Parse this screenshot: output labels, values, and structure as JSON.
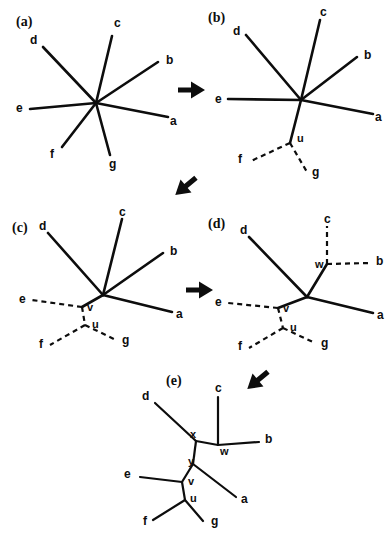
{
  "figure": {
    "background_color": "#ffffff",
    "ink_color": "#0d0d0d",
    "panels": [
      {
        "id": "a",
        "label": "(a)",
        "label_pos": [
          16,
          26
        ],
        "center": [
          96,
          103
        ],
        "solid_edges": [
          {
            "from": "center",
            "to": [
              43,
              47
            ],
            "taxon": "d"
          },
          {
            "from": "center",
            "to": [
              112,
              36
            ],
            "taxon": "c"
          },
          {
            "from": "center",
            "to": [
              158,
              62
            ],
            "taxon": "b"
          },
          {
            "from": "center",
            "to": [
              168,
              117
            ],
            "taxon": "a"
          },
          {
            "from": "center",
            "to": [
              30,
              109
            ],
            "taxon": "e"
          },
          {
            "from": "center",
            "to": [
              62,
              147
            ],
            "taxon": "f"
          },
          {
            "from": "center",
            "to": [
              110,
              155
            ],
            "taxon": "g"
          }
        ],
        "dashed_edges": [],
        "taxon_labels": [
          {
            "text": "d",
            "x": 30,
            "y": 44
          },
          {
            "text": "c",
            "x": 114,
            "y": 27
          },
          {
            "text": "b",
            "x": 166,
            "y": 64
          },
          {
            "text": "a",
            "x": 170,
            "y": 125
          },
          {
            "text": "e",
            "x": 16,
            "y": 112
          },
          {
            "text": "f",
            "x": 50,
            "y": 158
          },
          {
            "text": "g",
            "x": 109,
            "y": 168
          }
        ],
        "node_labels": []
      },
      {
        "id": "b",
        "label": "(b)",
        "label_pos": [
          208,
          22
        ],
        "center": [
          301,
          100
        ],
        "solid_edges": [
          {
            "from": "center",
            "to": [
              246,
              35
            ],
            "taxon": "d"
          },
          {
            "from": "center",
            "to": [
              320,
              20
            ],
            "taxon": "c"
          },
          {
            "from": "center",
            "to": [
              357,
              57
            ],
            "taxon": "b"
          },
          {
            "from": "center",
            "to": [
              373,
              114
            ],
            "taxon": "a"
          },
          {
            "from": "center",
            "to": [
              228,
              99
            ],
            "taxon": "e"
          },
          {
            "from": "center",
            "to": [
              290,
              143
            ],
            "taxon": "u"
          }
        ],
        "dashed_edges": [
          {
            "from": [
              290,
              143
            ],
            "to": [
              251,
              161
            ],
            "taxon": "f"
          },
          {
            "from": [
              290,
              143
            ],
            "to": [
              307,
              172
            ],
            "taxon": "g"
          }
        ],
        "taxon_labels": [
          {
            "text": "d",
            "x": 233,
            "y": 35
          },
          {
            "text": "c",
            "x": 320,
            "y": 16
          },
          {
            "text": "b",
            "x": 364,
            "y": 59
          },
          {
            "text": "a",
            "x": 375,
            "y": 121
          },
          {
            "text": "e",
            "x": 215,
            "y": 103
          },
          {
            "text": "f",
            "x": 238,
            "y": 163
          },
          {
            "text": "g",
            "x": 312,
            "y": 176
          }
        ],
        "node_labels": [
          {
            "text": "u",
            "x": 297,
            "y": 142
          }
        ]
      },
      {
        "id": "c",
        "label": "(c)",
        "label_pos": [
          12,
          232
        ],
        "center": [
          103,
          295
        ],
        "solid_edges": [
          {
            "from": "center",
            "to": [
              48,
              233
            ],
            "taxon": "d"
          },
          {
            "from": "center",
            "to": [
              122,
              219
            ],
            "taxon": "c"
          },
          {
            "from": "center",
            "to": [
              163,
              253
            ],
            "taxon": "b"
          },
          {
            "from": "center",
            "to": [
              172,
              312
            ],
            "taxon": "a"
          },
          {
            "from": "center",
            "to": [
              82,
              307
            ],
            "taxon": "v"
          }
        ],
        "dashed_edges": [
          {
            "from": [
              82,
              307
            ],
            "to": [
              32,
              300
            ],
            "taxon": "e"
          },
          {
            "from": [
              82,
              307
            ],
            "to": [
              85,
              325
            ],
            "taxon": "u"
          },
          {
            "from": [
              85,
              325
            ],
            "to": [
              50,
              345
            ],
            "taxon": "f"
          },
          {
            "from": [
              85,
              325
            ],
            "to": [
              116,
              340
            ],
            "taxon": "g"
          }
        ],
        "taxon_labels": [
          {
            "text": "d",
            "x": 39,
            "y": 230
          },
          {
            "text": "c",
            "x": 119,
            "y": 216
          },
          {
            "text": "b",
            "x": 170,
            "y": 255
          },
          {
            "text": "a",
            "x": 176,
            "y": 318
          },
          {
            "text": "e",
            "x": 19,
            "y": 303
          },
          {
            "text": "f",
            "x": 39,
            "y": 348
          },
          {
            "text": "g",
            "x": 122,
            "y": 344
          }
        ],
        "node_labels": [
          {
            "text": "v",
            "x": 87,
            "y": 311
          },
          {
            "text": "u",
            "x": 92,
            "y": 328
          }
        ]
      },
      {
        "id": "d",
        "label": "(d)",
        "label_pos": [
          208,
          228
        ],
        "center": [
          307,
          297
        ],
        "solid_edges": [
          {
            "from": "center",
            "to": [
              249,
              237
            ],
            "taxon": "d"
          },
          {
            "from": "center",
            "to": [
              327,
              264
            ],
            "taxon": "w"
          },
          {
            "from": "center",
            "to": [
              373,
              313
            ],
            "taxon": "a"
          },
          {
            "from": "center",
            "to": [
              278,
              308
            ],
            "taxon": "v"
          }
        ],
        "dashed_edges": [
          {
            "from": [
              327,
              264
            ],
            "to": [
              327,
              226
            ],
            "taxon": "c"
          },
          {
            "from": [
              327,
              264
            ],
            "to": [
              370,
              263
            ],
            "taxon": "b"
          },
          {
            "from": [
              278,
              308
            ],
            "to": [
              228,
              303
            ],
            "taxon": "e"
          },
          {
            "from": [
              278,
              308
            ],
            "to": [
              283,
              328
            ],
            "taxon": "u"
          },
          {
            "from": [
              283,
              328
            ],
            "to": [
              249,
              348
            ],
            "taxon": "f"
          },
          {
            "from": [
              283,
              328
            ],
            "to": [
              315,
              343
            ],
            "taxon": "g"
          }
        ],
        "taxon_labels": [
          {
            "text": "d",
            "x": 240,
            "y": 234
          },
          {
            "text": "c",
            "x": 324,
            "y": 223
          },
          {
            "text": "b",
            "x": 376,
            "y": 265
          },
          {
            "text": "a",
            "x": 377,
            "y": 319
          },
          {
            "text": "e",
            "x": 215,
            "y": 306
          },
          {
            "text": "f",
            "x": 238,
            "y": 350
          },
          {
            "text": "g",
            "x": 321,
            "y": 347
          }
        ],
        "node_labels": [
          {
            "text": "w",
            "x": 315,
            "y": 268
          },
          {
            "text": "v",
            "x": 283,
            "y": 312
          },
          {
            "text": "u",
            "x": 290,
            "y": 331
          }
        ]
      },
      {
        "id": "e",
        "label": "(e)",
        "label_pos": [
          166,
          385
        ],
        "center": null,
        "solid_edges": [
          {
            "from": [
              196,
              441
            ],
            "to": [
              155,
              403
            ],
            "taxon": "d"
          },
          {
            "from": [
              196,
              441
            ],
            "to": [
              218,
              445
            ],
            "taxon": "w"
          },
          {
            "from": [
              218,
              445
            ],
            "to": [
              218,
              397
            ],
            "taxon": "c"
          },
          {
            "from": [
              218,
              445
            ],
            "to": [
              259,
              442
            ],
            "taxon": "b"
          },
          {
            "from": [
              196,
              441
            ],
            "to": [
              193,
              464
            ],
            "taxon": "y"
          },
          {
            "from": [
              193,
              464
            ],
            "to": [
              182,
              482
            ],
            "taxon": "v"
          },
          {
            "from": [
              193,
              464
            ],
            "to": [
              236,
              497
            ],
            "taxon": "a"
          },
          {
            "from": [
              182,
              482
            ],
            "to": [
              140,
              477
            ],
            "taxon": "e"
          },
          {
            "from": [
              182,
              482
            ],
            "to": [
              185,
              500
            ],
            "taxon": "u"
          },
          {
            "from": [
              185,
              500
            ],
            "to": [
              153,
              520
            ],
            "taxon": "f"
          },
          {
            "from": [
              185,
              500
            ],
            "to": [
              203,
              521
            ],
            "taxon": "g"
          }
        ],
        "dashed_edges": [],
        "taxon_labels": [
          {
            "text": "d",
            "x": 142,
            "y": 400
          },
          {
            "text": "c",
            "x": 215,
            "y": 392
          },
          {
            "text": "b",
            "x": 265,
            "y": 443
          },
          {
            "text": "a",
            "x": 241,
            "y": 503
          },
          {
            "text": "e",
            "x": 124,
            "y": 478
          },
          {
            "text": "f",
            "x": 143,
            "y": 525
          },
          {
            "text": "g",
            "x": 211,
            "y": 525
          }
        ],
        "node_labels": [
          {
            "text": "x",
            "x": 190,
            "y": 438
          },
          {
            "text": "w",
            "x": 220,
            "y": 455
          },
          {
            "text": "y",
            "x": 188,
            "y": 465
          },
          {
            "text": "v",
            "x": 188,
            "y": 485
          },
          {
            "text": "u",
            "x": 190,
            "y": 502
          }
        ]
      }
    ],
    "arrows": [
      {
        "id": "arrow-a-to-b",
        "x": 191,
        "y": 90,
        "angle": 0
      },
      {
        "id": "arrow-b-to-c",
        "x": 186,
        "y": 186,
        "angle": 140
      },
      {
        "id": "arrow-c-to-d",
        "x": 199,
        "y": 290,
        "angle": 0
      },
      {
        "id": "arrow-d-to-e",
        "x": 258,
        "y": 380,
        "angle": 140
      }
    ]
  }
}
